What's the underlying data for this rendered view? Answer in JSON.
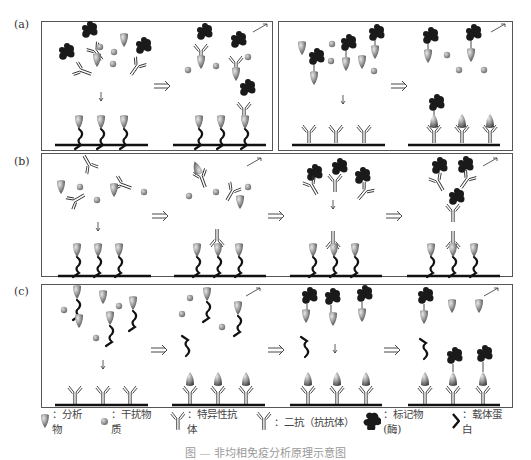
{
  "figure": {
    "rows": [
      {
        "label": "(a)",
        "description": "Competitive-type assays (two panels)"
      },
      {
        "label": "(b)",
        "description": "Indirect assay with secondary antibody"
      },
      {
        "label": "(c)",
        "description": "Carrier-protein competitive assay"
      }
    ],
    "arrow_symbol": "⟹",
    "legend": [
      {
        "icon": "analyte-icon",
        "label": "：分析物"
      },
      {
        "icon": "interferent-icon",
        "label": "：干扰物质"
      },
      {
        "icon": "specific-antibody-icon",
        "label": "：特异性抗体"
      },
      {
        "icon": "secondary-antibody-icon",
        "label": "：二抗（抗抗体）"
      },
      {
        "icon": "label-enzyme-icon",
        "label": "：标记物(酶)"
      },
      {
        "icon": "carrier-protein-icon",
        "label": "：载体蛋白"
      }
    ],
    "caption": "图 — 非均相免疫分析原理示意图",
    "colors": {
      "border": "#555555",
      "ink": "#111111",
      "analyte_gray": "#8a8a8a",
      "antibody_stroke": "#333333"
    }
  }
}
